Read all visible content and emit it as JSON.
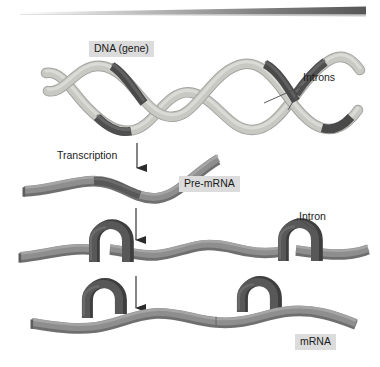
{
  "figure": {
    "width": 380,
    "height": 367,
    "background": "#ffffff"
  },
  "labels": {
    "dna_gene": "DNA (gene)",
    "introns_plural": "Introns",
    "transcription": "Transcription",
    "pre_mrna": "Pre-mRNA",
    "intron_singular": "Intron",
    "mrna": "mRNA"
  },
  "colors": {
    "exon_light": "#c9c9c4",
    "exon_light_shadow": "#a8a8a3",
    "intron_dark": "#585858",
    "intron_dark_shadow": "#3f3f3f",
    "rna_mid": "#8c8c8c",
    "rna_mid_shadow": "#6e6e6e",
    "label_box": "#dcdcdc",
    "text": "#1a1a1a",
    "arrow": "#2b2b2b",
    "leader_line": "#4a4a4a",
    "top_bar_dark": "#5e5e5e",
    "top_bar_light": "#f2f2f2"
  },
  "stages": [
    {
      "id": "dna",
      "name": "DNA (gene)",
      "description": "Double-stranded DNA helix with light exon regions and dark intron regions",
      "strands": 2
    },
    {
      "id": "pre-mrna",
      "name": "Pre-mRNA",
      "description": "Single wavy RNA strand transcribed from DNA, still containing intron sequences"
    },
    {
      "id": "pre-mrna-looped",
      "name": "Pre-mRNA with intron loops",
      "description": "Introns loop out of the strand as dark hairpin loops prior to excision",
      "intron_loops": 2
    },
    {
      "id": "mrna",
      "name": "mRNA",
      "description": "Mature mRNA after introns are excised; excised introns float free above the strand",
      "excised_introns": 2
    }
  ],
  "arrows": [
    {
      "id": "arrow-transcription",
      "from_stage": "dna",
      "to_stage": "pre-mrna",
      "label": "Transcription",
      "direction": "down"
    },
    {
      "id": "arrow-splicing-1",
      "from_stage": "pre-mrna",
      "to_stage": "pre-mrna-looped",
      "label": "",
      "direction": "down"
    },
    {
      "id": "arrow-splicing-2",
      "from_stage": "pre-mrna-looped",
      "to_stage": "mrna",
      "label": "",
      "direction": "down"
    }
  ],
  "callouts": [
    {
      "id": "callout-introns",
      "label": "Introns",
      "targets": 2,
      "stage": "dna"
    },
    {
      "id": "callout-intron",
      "label": "Intron",
      "targets": 1,
      "stage": "pre-mrna-looped"
    }
  ],
  "top_bar": {
    "id": "top-wedge-bar",
    "description": "Tapered horizontal wedge fading from light at left to dark at right",
    "x_start": 20,
    "x_end": 366,
    "y": 13
  }
}
